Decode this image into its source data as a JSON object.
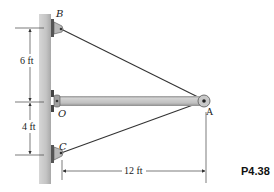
{
  "figure": {
    "problem_label": "P4.38",
    "points": {
      "B": "B",
      "O": "O",
      "C": "C",
      "A": "A"
    },
    "dimensions": {
      "upper_vertical": "6 ft",
      "lower_vertical": "4 ft",
      "horizontal": "12 ft"
    },
    "colors": {
      "wall": "#c8c8c8",
      "wall_dark": "#a9a9a9",
      "beam": "#c4c4c4",
      "bracket": "#555555",
      "cable": "#333333",
      "dimension_line": "#444444"
    }
  }
}
